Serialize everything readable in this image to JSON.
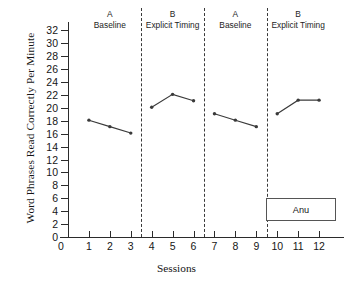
{
  "chart_data": {
    "type": "line",
    "title": "",
    "subtitle": "",
    "xlabel": "Sessions",
    "ylabel": "Word Phrases Read Correctly Per Minute",
    "xlim": [
      0,
      13
    ],
    "ylim": [
      0,
      33
    ],
    "grid": false,
    "legend_position": "lower-right",
    "legend_entries": [
      "Anu"
    ],
    "participant": "Anu",
    "x_ticks": [
      0,
      1,
      2,
      3,
      4,
      5,
      6,
      7,
      8,
      9,
      10,
      11,
      12
    ],
    "x_tick_labels": [
      "0",
      "1",
      "2",
      "3",
      "4",
      "5",
      "6",
      "7",
      "8",
      "9",
      "10",
      "11",
      "12"
    ],
    "y_ticks": [
      0,
      2,
      4,
      6,
      8,
      10,
      12,
      14,
      16,
      18,
      20,
      22,
      24,
      26,
      28,
      30,
      32
    ],
    "y_tick_labels": [
      "0",
      "2",
      "4",
      "6",
      "8",
      "10",
      "12",
      "14",
      "16",
      "18",
      "20",
      "22",
      "24",
      "26",
      "28",
      "30",
      "32"
    ],
    "phase_dividers": [
      3.5,
      6.5,
      9.5
    ],
    "phases": [
      {
        "letter": "A",
        "name": "Baseline",
        "center_x": 2.0,
        "sessions": [
          1,
          2,
          3
        ]
      },
      {
        "letter": "B",
        "name": "Explicit Timing",
        "center_x": 5.0,
        "sessions": [
          4,
          5,
          6
        ]
      },
      {
        "letter": "A",
        "name": "Baseline",
        "center_x": 8.0,
        "sessions": [
          7,
          8,
          9
        ]
      },
      {
        "letter": "B",
        "name": "Explicit Timing",
        "center_x": 11.0,
        "sessions": [
          10,
          11,
          12
        ]
      }
    ],
    "series": [
      {
        "name": "Anu",
        "color": "#3a3a3a",
        "marker": "dot",
        "segments": [
          {
            "phase": "A Baseline",
            "x": [
              1,
              2,
              3
            ],
            "y": [
              18.1,
              17.1,
              16.1
            ]
          },
          {
            "phase": "B Explicit Timing",
            "x": [
              4,
              5,
              6
            ],
            "y": [
              20.1,
              22.1,
              21.1
            ]
          },
          {
            "phase": "A Baseline",
            "x": [
              7,
              8,
              9
            ],
            "y": [
              19.1,
              18.1,
              17.1
            ]
          },
          {
            "phase": "B Explicit Timing",
            "x": [
              10,
              11,
              12
            ],
            "y": [
              19.1,
              21.2,
              21.2
            ]
          }
        ]
      }
    ]
  },
  "axes": {
    "x_title": "Sessions",
    "y_title": "Word Phrases Read Correctly Per Minute"
  },
  "legend": {
    "label": "Anu"
  }
}
